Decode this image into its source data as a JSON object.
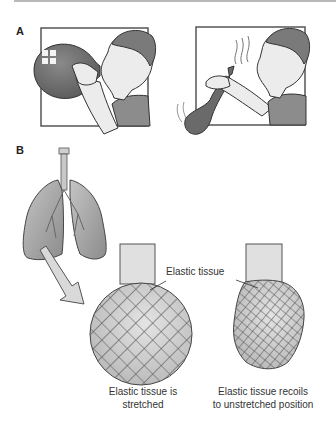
{
  "figure": {
    "panels": [
      {
        "label": "A",
        "description": "Person inflating a balloon, then releasing it as it deflates"
      },
      {
        "label": "B",
        "description": "Lungs with alveolus elastic tissue stretched vs recoiled"
      }
    ],
    "callout": "Elastic tissue",
    "captions": {
      "stretched": [
        "Elastic tissue is",
        "stretched"
      ],
      "recoiled": [
        "Elastic tissue recoils",
        "to unstretched position"
      ]
    },
    "colors": {
      "balloon": "#6e6e6e",
      "skin": "#ececec",
      "hair": "#7a7a7a",
      "shirt": "#8c8c8c",
      "frame": "#555555",
      "lung": "#a8a8a8",
      "mesh": "#555555",
      "arrow": "#d9d9d9"
    }
  }
}
